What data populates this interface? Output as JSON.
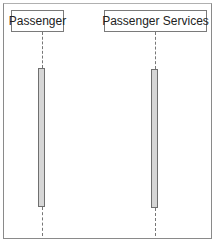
{
  "diagram": {
    "type": "sequence",
    "participants": [
      {
        "label": "Passenger"
      },
      {
        "label": "Passenger Services"
      }
    ],
    "colors": {
      "border": "#7a7a7a",
      "activation_fill": "#d6d6d6",
      "lifeline": "#777777"
    }
  }
}
